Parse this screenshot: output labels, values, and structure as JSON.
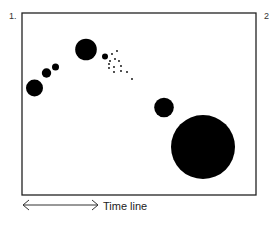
{
  "figure": {
    "panel_label_left": "1.",
    "panel_label_right": "2",
    "timeline_label": "Time line",
    "colors": {
      "frame": "#222222",
      "circle": "#000000",
      "background": "#ffffff"
    },
    "frame": {
      "x": 22,
      "y": 13,
      "width": 234,
      "height": 182
    },
    "circles": [
      {
        "cx": 34.5,
        "cy": 88,
        "r": 8.5
      },
      {
        "cx": 46.5,
        "cy": 73,
        "r": 4.7
      },
      {
        "cx": 55.5,
        "cy": 67,
        "r": 3.5
      },
      {
        "cx": 86,
        "cy": 49.5,
        "r": 10.8
      },
      {
        "cx": 105,
        "cy": 56.5,
        "r": 3
      },
      {
        "cx": 164,
        "cy": 107.5,
        "r": 9.8
      },
      {
        "cx": 203,
        "cy": 147,
        "r": 32
      }
    ],
    "dots": [
      {
        "cx": 112,
        "cy": 54
      },
      {
        "cx": 117,
        "cy": 51
      },
      {
        "cx": 110,
        "cy": 61
      },
      {
        "cx": 115,
        "cy": 59
      },
      {
        "cx": 119,
        "cy": 61
      },
      {
        "cx": 109,
        "cy": 64
      },
      {
        "cx": 109,
        "cy": 68
      },
      {
        "cx": 114,
        "cy": 67
      },
      {
        "cx": 121,
        "cy": 66
      },
      {
        "cx": 121,
        "cy": 71
      },
      {
        "cx": 114,
        "cy": 72
      },
      {
        "cx": 127,
        "cy": 72
      },
      {
        "cx": 132,
        "cy": 79
      }
    ]
  }
}
